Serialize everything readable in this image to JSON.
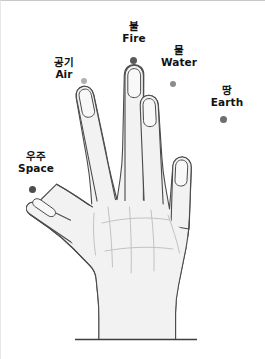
{
  "figure": {
    "background_color": "#ffffff",
    "hand": {
      "fill_color": "#f2f2f2",
      "outline_color": "#4a4a4a",
      "crease_color": "#b9b9b9",
      "nail_color": "#f7f7f7",
      "wrist_line_color": "#3f3f3f"
    }
  },
  "labels": [
    {
      "id": "fire",
      "korean": "불",
      "english": "Fire",
      "finger": "middle-finger",
      "dot_color": "#5a5a5a"
    },
    {
      "id": "water",
      "korean": "물",
      "english": "Water",
      "finger": "ring-finger",
      "dot_color": "#8c8c8c"
    },
    {
      "id": "air",
      "korean": "공기",
      "english": "Air",
      "finger": "index-finger",
      "dot_color": "#b0b0b0"
    },
    {
      "id": "earth",
      "korean": "땅",
      "english": "Earth",
      "finger": "little-finger",
      "dot_color": "#6e6e6e"
    },
    {
      "id": "space",
      "korean": "우주",
      "english": "Space",
      "finger": "thumb",
      "dot_color": "#4d4d4d"
    }
  ]
}
